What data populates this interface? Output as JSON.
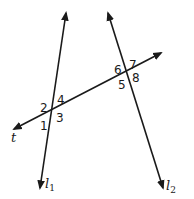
{
  "diagram": {
    "colors": {
      "stroke": "#1a1a1a",
      "background": "#ffffff"
    },
    "lines": [
      {
        "id": "l1",
        "label": "l",
        "subscript": "1",
        "from": [
          66,
          13
        ],
        "to": [
          40,
          188
        ],
        "arrows": "both",
        "label_pos": [
          45,
          188
        ]
      },
      {
        "id": "l2",
        "label": "l",
        "subscript": "2",
        "from": [
          108,
          13
        ],
        "to": [
          163,
          188
        ],
        "arrows": "both",
        "label_pos": [
          166,
          190
        ]
      },
      {
        "id": "t",
        "label": "t",
        "subscript": "",
        "from": [
          161,
          53
        ],
        "to": [
          14,
          129
        ],
        "arrows": "both",
        "label_pos": [
          11,
          142
        ]
      }
    ],
    "intersections": [
      {
        "lines": [
          "l1",
          "t"
        ],
        "point": [
          51,
          110
        ]
      },
      {
        "lines": [
          "l2",
          "t"
        ],
        "point": [
          126,
          71
        ]
      }
    ],
    "angles": [
      {
        "number": "1",
        "pos": [
          40,
          130
        ]
      },
      {
        "number": "2",
        "pos": [
          40,
          112
        ]
      },
      {
        "number": "3",
        "pos": [
          56,
          122
        ]
      },
      {
        "number": "4",
        "pos": [
          57,
          104
        ]
      },
      {
        "number": "5",
        "pos": [
          118,
          89
        ]
      },
      {
        "number": "6",
        "pos": [
          114,
          74
        ]
      },
      {
        "number": "7",
        "pos": [
          129,
          69
        ]
      },
      {
        "number": "8",
        "pos": [
          132,
          82
        ]
      }
    ]
  }
}
